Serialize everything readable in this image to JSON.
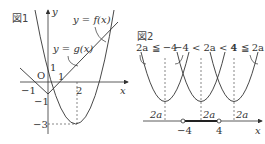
{
  "figure1": {
    "title": "図1",
    "axis_x_label": "x",
    "axis_y_label": "y",
    "origin_label": "O",
    "tick_labels": {
      "x_neg1": "−1",
      "x_1": "1",
      "x_2": "2",
      "y_1": "1",
      "y_neg1": "−1",
      "y_neg3": "−3"
    },
    "curve_labels": {
      "f": "y = f(x)",
      "g": "y = g(x)"
    }
  },
  "figure2": {
    "title": "図2",
    "case_labels": [
      "2a ≦ −4",
      "−4 < 2a < 4",
      "4 ≦ 2a"
    ],
    "vertex_labels": [
      "2a",
      "2a",
      "2a"
    ],
    "axis_x_label": "x",
    "tick_labels": [
      "−4",
      "4"
    ]
  },
  "colors": {
    "line": "#333333",
    "dashed": "#555555",
    "interval": "#222222"
  }
}
